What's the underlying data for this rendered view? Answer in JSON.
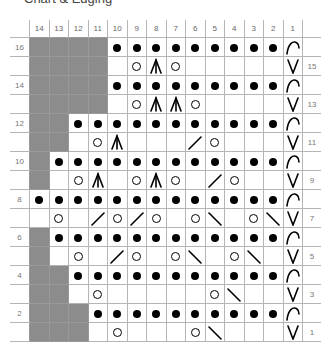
{
  "title": "Chart & Edging",
  "columns": [
    "14",
    "13",
    "12",
    "11",
    "10",
    "9",
    "8",
    "7",
    "6",
    "5",
    "4",
    "3",
    "2",
    "1"
  ],
  "legend_symbols": {
    "G": "no-stitch (grey)",
    "P": "purl (dot)",
    "O": "yarn over",
    "A": "central double decrease",
    "R": "k2tog (right slant)",
    "L": "ssk (left slant)",
    "V": "slip stitch",
    "C": "edge arc",
    "_": "knit (blank)"
  },
  "rows": [
    {
      "num": "16",
      "label_side": "left",
      "cells": [
        "G",
        "G",
        "G",
        "G",
        "P",
        "P",
        "P",
        "P",
        "P",
        "P",
        "P",
        "P",
        "P",
        "C"
      ]
    },
    {
      "num": "15",
      "label_side": "right",
      "cells": [
        "G",
        "G",
        "G",
        "G",
        "_",
        "O",
        "A",
        "O",
        "_",
        "_",
        "_",
        "_",
        "_",
        "V"
      ]
    },
    {
      "num": "14",
      "label_side": "left",
      "cells": [
        "G",
        "G",
        "G",
        "G",
        "P",
        "P",
        "P",
        "P",
        "P",
        "P",
        "P",
        "P",
        "P",
        "C"
      ]
    },
    {
      "num": "13",
      "label_side": "right",
      "cells": [
        "G",
        "G",
        "G",
        "G",
        "_",
        "O",
        "A",
        "A",
        "O",
        "_",
        "_",
        "_",
        "_",
        "V"
      ]
    },
    {
      "num": "12",
      "label_side": "left",
      "cells": [
        "G",
        "G",
        "P",
        "P",
        "P",
        "P",
        "P",
        "P",
        "P",
        "P",
        "P",
        "P",
        "P",
        "C"
      ]
    },
    {
      "num": "11",
      "label_side": "right",
      "cells": [
        "G",
        "G",
        "_",
        "O",
        "A",
        "_",
        "_",
        "_",
        "R",
        "O",
        "_",
        "_",
        "_",
        "V"
      ]
    },
    {
      "num": "10",
      "label_side": "left",
      "cells": [
        "G",
        "P",
        "P",
        "P",
        "P",
        "P",
        "P",
        "P",
        "P",
        "P",
        "P",
        "P",
        "P",
        "C"
      ]
    },
    {
      "num": "9",
      "label_side": "right",
      "cells": [
        "G",
        "_",
        "O",
        "A",
        "_",
        "O",
        "A",
        "O",
        "_",
        "R",
        "O",
        "_",
        "_",
        "V"
      ]
    },
    {
      "num": "8",
      "label_side": "left",
      "cells": [
        "P",
        "P",
        "P",
        "P",
        "P",
        "P",
        "P",
        "P",
        "P",
        "P",
        "P",
        "P",
        "P",
        "C"
      ]
    },
    {
      "num": "7",
      "label_side": "right",
      "cells": [
        "_",
        "O",
        "_",
        "R",
        "O",
        "R",
        "O",
        "_",
        "O",
        "L",
        "_",
        "O",
        "L",
        "V"
      ]
    },
    {
      "num": "6",
      "label_side": "left",
      "cells": [
        "G",
        "P",
        "P",
        "P",
        "P",
        "P",
        "P",
        "P",
        "P",
        "P",
        "P",
        "P",
        "P",
        "C"
      ]
    },
    {
      "num": "5",
      "label_side": "right",
      "cells": [
        "G",
        "_",
        "O",
        "_",
        "R",
        "O",
        "_",
        "O",
        "L",
        "_",
        "O",
        "L",
        "_",
        "V"
      ]
    },
    {
      "num": "4",
      "label_side": "left",
      "cells": [
        "G",
        "G",
        "P",
        "P",
        "P",
        "P",
        "P",
        "P",
        "P",
        "P",
        "P",
        "P",
        "P",
        "C"
      ]
    },
    {
      "num": "3",
      "label_side": "right",
      "cells": [
        "G",
        "G",
        "_",
        "O",
        "_",
        "_",
        "_",
        "_",
        "_",
        "O",
        "L",
        "_",
        "_",
        "V"
      ]
    },
    {
      "num": "2",
      "label_side": "left",
      "cells": [
        "G",
        "G",
        "G",
        "P",
        "P",
        "P",
        "P",
        "P",
        "P",
        "P",
        "P",
        "P",
        "P",
        "C"
      ]
    },
    {
      "num": "1",
      "label_side": "right",
      "cells": [
        "G",
        "G",
        "G",
        "_",
        "O",
        "_",
        "_",
        "_",
        "O",
        "L",
        "_",
        "_",
        "_",
        "V"
      ]
    }
  ],
  "colors": {
    "grey_cell": "#8c8c8c",
    "grid_line": "#b5b5b5",
    "symbol": "#000000"
  }
}
